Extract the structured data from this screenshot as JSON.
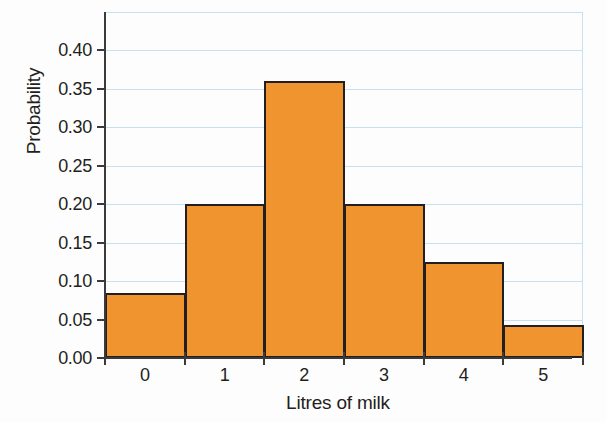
{
  "chart_data": {
    "type": "bar",
    "title": "",
    "xlabel": "Litres of milk",
    "ylabel": "Probability",
    "categories": [
      "0",
      "1",
      "2",
      "3",
      "4",
      "5"
    ],
    "values": [
      0.084,
      0.2,
      0.36,
      0.2,
      0.125,
      0.043
    ],
    "xlim": [
      -0.5,
      5.5
    ],
    "ylim": [
      0.0,
      0.45
    ],
    "ytick_labels": [
      "0.00",
      "0.05",
      "0.10",
      "0.15",
      "0.20",
      "0.25",
      "0.30",
      "0.35",
      "0.40"
    ],
    "ytick_values": [
      0.0,
      0.05,
      0.1,
      0.15,
      0.2,
      0.25,
      0.3,
      0.35,
      0.4
    ],
    "xtick_labels": [
      "0",
      "1",
      "2",
      "3",
      "4",
      "5"
    ],
    "bin_edges": [
      -0.5,
      0.5,
      1.5,
      2.5,
      3.5,
      4.5,
      5.5
    ],
    "grid": "horizontal",
    "legend": "none",
    "bar_fill_color": "#f0942f",
    "bar_edge_color": "#231f20",
    "gridline_color": "#c8e1f2",
    "axis_color": "#3b3b3b"
  },
  "axes": {
    "y_title": "Probability",
    "x_title": "Litres of milk"
  }
}
